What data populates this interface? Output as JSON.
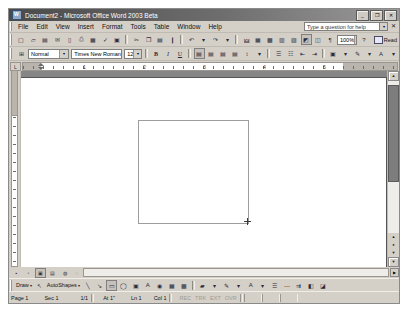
{
  "window": {
    "title": "Document2 - Microsoft Office Word 2003 Beta",
    "app_icon": "word-document-icon",
    "controls": {
      "minimize": "_",
      "restore": "❐",
      "close": "✕"
    }
  },
  "menubar": {
    "items": [
      {
        "label": "File"
      },
      {
        "label": "Edit"
      },
      {
        "label": "View"
      },
      {
        "label": "Insert"
      },
      {
        "label": "Format"
      },
      {
        "label": "Tools"
      },
      {
        "label": "Table"
      },
      {
        "label": "Window"
      },
      {
        "label": "Help"
      }
    ],
    "help_box": {
      "value": "Type a question for help",
      "caret": "▾",
      "close": "✕"
    }
  },
  "standard_toolbar": {
    "buttons": [
      "new-document-icon",
      "open-icon",
      "save-icon",
      "mail-recipient-icon",
      "permission-icon",
      "print-icon",
      "print-preview-icon",
      "spelling-grammar-icon",
      "research-icon",
      "cut-icon",
      "copy-icon",
      "paste-icon",
      "format-painter-icon",
      "undo-icon",
      "redo-icon",
      "insert-hyperlink-icon",
      "insert-table-icon",
      "insert-excel-table-icon",
      "columns-icon",
      "drawing-icon",
      "document-map-icon",
      "show-formatting-marks-icon"
    ],
    "zoom": {
      "value": "100%",
      "caret": "▾"
    },
    "help_button": "help-icon",
    "read_button": {
      "label": "Read",
      "icon": "read-layout-icon"
    }
  },
  "formatting_toolbar": {
    "style": {
      "value": "Normal",
      "caret": "▾",
      "icon": "styles-formatting-icon"
    },
    "font": {
      "value": "Times New Roman",
      "caret": "▾"
    },
    "size": {
      "value": "12",
      "caret": "▾"
    },
    "bold": "B",
    "italic": "I",
    "underline": "U",
    "align": [
      "align-left-icon",
      "align-center-icon",
      "align-right-icon",
      "justify-icon"
    ],
    "line_spacing": "line-spacing-icon",
    "numbering": "numbered-list-icon",
    "bullets": "bulleted-list-icon",
    "decrease_indent": "decrease-indent-icon",
    "increase_indent": "increase-indent-icon",
    "borders": "borders-icon",
    "highlight": "highlight-icon",
    "font_color": "font-color-icon"
  },
  "ruler": {
    "horizontal_numbers": [
      "1",
      "2",
      "3",
      "4",
      "5"
    ],
    "corner_tab": "tab-stop-selector",
    "units": "inches"
  },
  "document": {
    "page_background": "#ffffff",
    "workspace_background": "#868686",
    "shape": {
      "type": "rectangle",
      "border_color": "#9d9d9d",
      "left_pct": 32,
      "top_pct": 22,
      "width_pct": 30,
      "height_pct": 54
    },
    "cursor": "crosshair-cursor"
  },
  "view_buttons": [
    {
      "name": "normal-view",
      "active": false
    },
    {
      "name": "web-layout-view",
      "active": false
    },
    {
      "name": "print-layout-view",
      "active": true
    },
    {
      "name": "outline-view",
      "active": false
    },
    {
      "name": "reading-layout-view",
      "active": false
    }
  ],
  "scrollbars": {
    "vertical": {
      "up": "▲",
      "down": "▼",
      "browse_previous": "▲",
      "browse_select": "●",
      "browse_next": "▼"
    },
    "horizontal": {
      "left": "◀",
      "right": "▶"
    }
  },
  "drawing_toolbar": {
    "draw_menu": {
      "label": "Draw",
      "caret": "▾"
    },
    "select_objects": "select-objects-icon",
    "autoshapes_menu": {
      "label": "AutoShapes",
      "caret": "▾"
    },
    "tools": [
      "line-icon",
      "arrow-icon",
      "rectangle-icon",
      "oval-icon",
      "text-box-icon",
      "wordart-icon",
      "diagram-icon",
      "clip-art-icon",
      "picture-icon",
      "fill-color-icon",
      "line-color-icon",
      "font-color-icon",
      "line-style-icon",
      "dash-style-icon",
      "arrow-style-icon",
      "shadow-style-icon",
      "3d-style-icon"
    ]
  },
  "status_bar": {
    "page": "Page 1",
    "section": "Sec 1",
    "pages": "1/1",
    "at": "At 1\"",
    "line": "Ln 1",
    "column": "Col 1",
    "indicators": [
      "REC",
      "TRK",
      "EXT",
      "OVR"
    ]
  }
}
